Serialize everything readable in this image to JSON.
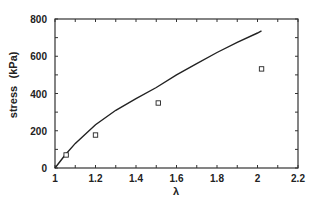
{
  "chart_data": {
    "type": "line",
    "title": "",
    "xlabel": "λ",
    "ylabel": "stress",
    "ylabel_unit": "(kPa)",
    "xlim": [
      1,
      2.2
    ],
    "ylim": [
      0,
      800
    ],
    "grid": false,
    "legend": null,
    "x_ticks": [
      "1",
      "1.2",
      "1.4",
      "1.6",
      "1.8",
      "2",
      "2.2"
    ],
    "y_ticks": [
      "0",
      "200",
      "400",
      "600",
      "800"
    ],
    "series": [
      {
        "name": "model",
        "style": "line",
        "color": "#222222",
        "x": [
          1.0,
          1.05,
          1.1,
          1.2,
          1.3,
          1.4,
          1.5,
          1.6,
          1.7,
          1.8,
          1.9,
          2.0,
          2.02
        ],
        "y": [
          0,
          70,
          132,
          232,
          310,
          372,
          432,
          500,
          560,
          620,
          675,
          725,
          736
        ]
      },
      {
        "name": "data",
        "style": "square-markers",
        "color": "#222222",
        "x": [
          1.055,
          1.2,
          1.51,
          2.02
        ],
        "y": [
          70,
          177,
          349,
          532
        ]
      }
    ]
  }
}
